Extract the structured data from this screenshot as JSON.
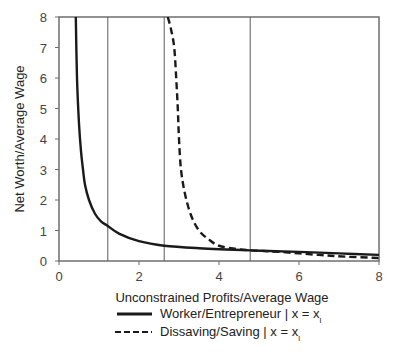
{
  "chart_data": {
    "type": "line",
    "title": "",
    "xlabel": "Unconstrained Profits/Average Wage",
    "ylabel": "Net Worth/Average Wage",
    "xlim": [
      0,
      8
    ],
    "ylim": [
      0,
      8
    ],
    "xticks": [
      0,
      2,
      4,
      6,
      8
    ],
    "yticks": [
      0,
      1,
      2,
      3,
      4,
      5,
      6,
      7,
      8
    ],
    "xtick_labels": [
      "0",
      "2",
      "4",
      "6",
      "8"
    ],
    "ytick_labels": [
      "0",
      "1",
      "2",
      "3",
      "4",
      "5",
      "6",
      "7",
      "8"
    ],
    "grid": false,
    "vertical_lines": [
      1.22,
      2.63,
      4.78
    ],
    "legend_position": "bottom",
    "series": [
      {
        "name": "Worker/Entrepreneur | x = x",
        "subscript": "l",
        "style": "solid",
        "x": [
          0.42,
          0.45,
          0.5,
          0.55,
          0.6,
          0.65,
          0.75,
          0.9,
          1.05,
          1.22,
          1.5,
          2.0,
          2.63,
          3.5,
          4.78,
          6.0,
          7.0,
          8.0
        ],
        "y": [
          8.0,
          6.0,
          4.5,
          3.6,
          3.0,
          2.5,
          2.0,
          1.55,
          1.3,
          1.15,
          0.9,
          0.65,
          0.5,
          0.42,
          0.35,
          0.3,
          0.25,
          0.2
        ]
      },
      {
        "name": "Dissaving/Saving | x = x",
        "subscript": "l",
        "style": "dashed",
        "x": [
          2.72,
          2.8,
          2.88,
          2.93,
          2.97,
          3.0,
          3.05,
          3.15,
          3.3,
          3.5,
          3.75,
          4.0,
          4.4,
          4.78,
          5.5,
          6.5,
          7.2,
          8.0
        ],
        "y": [
          8.0,
          7.6,
          7.0,
          6.0,
          5.0,
          4.0,
          3.0,
          2.2,
          1.5,
          1.0,
          0.7,
          0.5,
          0.4,
          0.35,
          0.3,
          0.2,
          0.14,
          0.1
        ]
      }
    ]
  },
  "legend": {
    "items": [
      {
        "label": "Worker/Entrepreneur | x = x",
        "subscript": "l",
        "style": "solid"
      },
      {
        "label": "Dissaving/Saving | x = x",
        "subscript": "l",
        "style": "dashed"
      }
    ]
  },
  "colors": {
    "axis": "#6e6e6e",
    "series_line": "#1a1a1a",
    "vline": "#5a5a5a"
  }
}
